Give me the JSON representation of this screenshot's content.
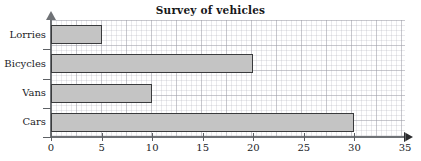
{
  "chart_data": {
    "type": "bar",
    "orientation": "horizontal",
    "title": "Survey of vehicles",
    "xlabel": "",
    "ylabel": "",
    "categories": [
      "Lorries",
      "Bicycles",
      "Vans",
      "Cars"
    ],
    "values": [
      5,
      20,
      10,
      30
    ],
    "xlim": [
      0,
      35
    ],
    "xticks": [
      0,
      5,
      10,
      15,
      20,
      25,
      30,
      35
    ],
    "xtick_labels": [
      "0",
      "5",
      "10",
      "15",
      "20",
      "25",
      "30",
      "35"
    ],
    "grid": true,
    "legend": null,
    "bar_color": "#c4c4c4",
    "bar_border_color": "#3a3b3d",
    "axis_color": "#6f7276",
    "title_color": "#17181a"
  }
}
